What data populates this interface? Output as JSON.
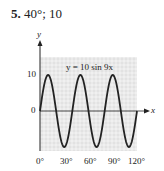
{
  "problem": {
    "number": "5.",
    "answer": "40°; 10"
  },
  "chart_data": {
    "type": "line",
    "title": "",
    "annotation": "y = 10 sin 9x",
    "xlabel": "x",
    "ylabel": "y",
    "x_ticks": [
      "0°",
      "30°",
      "60°",
      "90°",
      "120°"
    ],
    "y_ticks": [
      "10",
      "0"
    ],
    "xlim": [
      0,
      120
    ],
    "ylim": [
      -10,
      14
    ],
    "grid": true,
    "series": [
      {
        "name": "y = 10 sin 9x",
        "function": "10*sin(9x)",
        "period_deg": 40,
        "amplitude": 10,
        "x": [
          0,
          10,
          20,
          30,
          40,
          50,
          60,
          70,
          80,
          90,
          100,
          110,
          120
        ],
        "values": [
          0,
          10,
          0,
          -10,
          0,
          10,
          0,
          -10,
          0,
          10,
          0,
          -10,
          0
        ]
      }
    ]
  },
  "colors": {
    "grid_bg": "#e2e2e2",
    "grid_line": "#ffffff",
    "curve": "#222222"
  }
}
